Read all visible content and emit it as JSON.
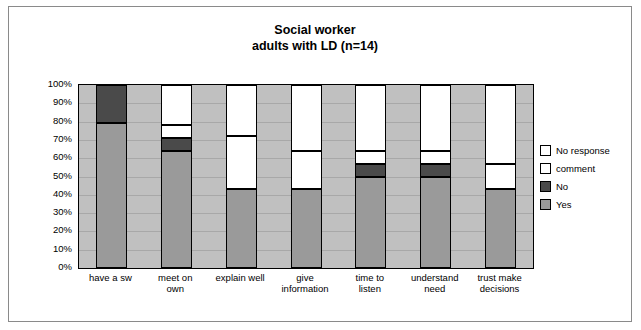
{
  "chart_data": {
    "type": "bar",
    "title": "Social worker\nadults with LD (n=14)",
    "title_line1": "Social worker",
    "title_line2": "adults with LD (n=14)",
    "xlabel": "",
    "ylabel": "",
    "ylim": [
      0,
      100
    ],
    "stacked": true,
    "percent": true,
    "grid": true,
    "legend_position": "right",
    "categories": [
      "have  a sw",
      "meet on\nown",
      "explain well",
      "give\ninformation",
      "time to\nlisten",
      "understand\nneed",
      "trust make\ndecisions"
    ],
    "category_labels": [
      [
        "have  a sw"
      ],
      [
        "meet on",
        "own"
      ],
      [
        "explain well"
      ],
      [
        "give",
        "information"
      ],
      [
        "time to",
        "listen"
      ],
      [
        "understand",
        "need"
      ],
      [
        "trust make",
        "decisions"
      ]
    ],
    "ytick_labels": [
      "100%",
      "90%",
      "80%",
      "70%",
      "60%",
      "50%",
      "40%",
      "30%",
      "20%",
      "10%",
      "0%"
    ],
    "yticks": [
      100,
      90,
      80,
      70,
      60,
      50,
      40,
      30,
      20,
      10,
      0
    ],
    "series": [
      {
        "name": "Yes",
        "color": "#9a9a9a",
        "values": [
          79,
          64,
          43,
          43,
          50,
          50,
          43
        ]
      },
      {
        "name": "No",
        "color": "#4a4a4a",
        "values": [
          21,
          7,
          0,
          0,
          7,
          7,
          0
        ]
      },
      {
        "name": "comment",
        "color": "#ffffff",
        "values": [
          0,
          7,
          29,
          21,
          7,
          7,
          14
        ]
      },
      {
        "name": "No response",
        "color": "#ffffff",
        "values": [
          0,
          22,
          28,
          36,
          36,
          36,
          43
        ]
      }
    ],
    "legend_entries": [
      {
        "label": "No response",
        "color": "#ffffff"
      },
      {
        "label": "comment",
        "color": "#ffffff"
      },
      {
        "label": "No",
        "color": "#4a4a4a"
      },
      {
        "label": "Yes",
        "color": "#9a9a9a"
      }
    ],
    "plot_background": "#c0c0c0"
  }
}
